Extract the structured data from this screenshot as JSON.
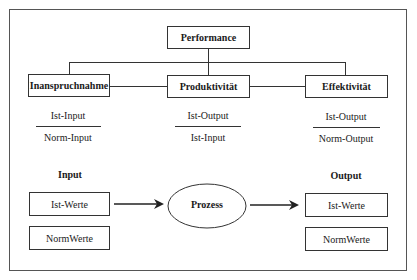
{
  "diagram": {
    "root": {
      "label": "Performance"
    },
    "metrics": [
      {
        "label": "Inanspruchnahme",
        "numerator": "Ist-Input",
        "denominator": "Norm-Input"
      },
      {
        "label": "Produktivität",
        "numerator": "Ist-Output",
        "denominator": "Ist-Input"
      },
      {
        "label": "Effektivität",
        "numerator": "Ist-Output",
        "denominator": "Norm-Output"
      }
    ],
    "input": {
      "heading": "Input",
      "boxes": [
        "Ist-Werte",
        "NormWerte"
      ]
    },
    "process": {
      "label": "Prozess"
    },
    "output": {
      "heading": "Output",
      "boxes": [
        "Ist-Werte",
        "NormWerte"
      ]
    }
  }
}
